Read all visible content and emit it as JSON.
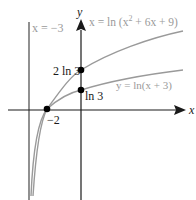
{
  "figure": {
    "asymptote_label": "x = −3",
    "curve1_label_pre": "x = ln (x",
    "curve1_label_sup": "2",
    "curve1_label_post": " + 6x + 9)",
    "curve2_label": "y = ln(x + 3)",
    "y_axis_label": "y",
    "x_axis_label": "x",
    "point_2ln3_label": "2 ln 3",
    "point_ln3_label": "ln 3",
    "point_neg2_label": "−2",
    "colors": {
      "axis": "#1a1a1a",
      "curve": "#9a9a9a",
      "asymptote": "#555555",
      "point": "#000000"
    }
  }
}
